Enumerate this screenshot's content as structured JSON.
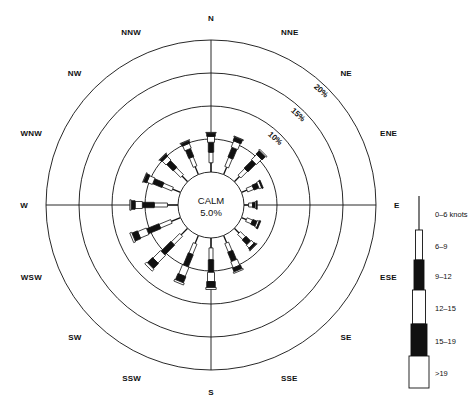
{
  "figure": {
    "title_visible": false,
    "caption": "",
    "center_label_line1": "CALM",
    "center_label_line2": "5.0%",
    "colors": {
      "stroke": "#111111",
      "fill_light": "#ffffff",
      "fill_dark": "#111111",
      "background": "#ffffff"
    }
  },
  "compass": {
    "labels": [
      "N",
      "NNE",
      "NE",
      "ENE",
      "E",
      "ESE",
      "SE",
      "SSE",
      "S",
      "SSW",
      "SW",
      "WSW",
      "W",
      "WNW",
      "NW",
      "NNW"
    ]
  },
  "rings": {
    "labels": [
      "10%",
      "15%",
      "20%"
    ],
    "values": [
      10,
      15,
      20
    ],
    "max": 20
  },
  "legend": {
    "items": [
      {
        "label": "0–6 knots",
        "fill": "line",
        "width": 1.5,
        "height": 34
      },
      {
        "label": "6–9",
        "fill": "white",
        "width": 7,
        "height": 30
      },
      {
        "label": "9–12",
        "fill": "black",
        "width": 10,
        "height": 30
      },
      {
        "label": "12–15",
        "fill": "white",
        "width": 13,
        "height": 34
      },
      {
        "label": "15–19",
        "fill": "black",
        "width": 16,
        "height": 32
      },
      {
        "label": ">19",
        "fill": "white",
        "width": 20,
        "height": 32
      }
    ]
  },
  "chart_data": {
    "type": "windrose",
    "title": "",
    "xlabel": "",
    "ylabel": "Frequency of occurrence (%)",
    "rlim": [
      0,
      20
    ],
    "grid": true,
    "calm_percent": 5.0,
    "radial_tick_labels": [
      "10%",
      "15%",
      "20%"
    ],
    "radial_ticks": [
      10,
      15,
      20
    ],
    "sectors": 16,
    "speed_bins": [
      "0–6 knots",
      "6–9",
      "9–12",
      "12–15",
      "15–19",
      ">19"
    ],
    "directions": [
      "N",
      "NNE",
      "NE",
      "ENE",
      "E",
      "ESE",
      "SE",
      "SSE",
      "S",
      "SSW",
      "SW",
      "WSW",
      "W",
      "WNW",
      "NW",
      "NNW"
    ],
    "series": [
      {
        "name": "0–6 knots",
        "values": [
          1.4,
          1.2,
          1.1,
          0.9,
          0.7,
          0.8,
          1.0,
          1.2,
          1.5,
          1.3,
          1.4,
          1.5,
          1.6,
          1.3,
          1.2,
          1.3
        ]
      },
      {
        "name": "6–9",
        "values": [
          1.6,
          1.5,
          1.4,
          1.0,
          0.6,
          0.9,
          1.1,
          1.4,
          1.8,
          1.7,
          1.8,
          1.9,
          2.0,
          1.6,
          1.5,
          1.5
        ]
      },
      {
        "name": "9–12",
        "values": [
          1.5,
          1.6,
          1.7,
          0.8,
          0.4,
          0.7,
          1.0,
          1.5,
          1.9,
          2.0,
          2.1,
          2.0,
          1.8,
          1.5,
          1.4,
          1.3
        ]
      },
      {
        "name": "12–15",
        "values": [
          0.9,
          1.0,
          1.1,
          0.4,
          0.2,
          0.3,
          0.6,
          1.0,
          1.4,
          1.5,
          1.6,
          1.4,
          1.1,
          0.9,
          0.8,
          0.8
        ]
      },
      {
        "name": "15–19",
        "values": [
          0.5,
          0.6,
          0.7,
          0.2,
          0.1,
          0.2,
          0.3,
          0.6,
          0.9,
          1.0,
          1.1,
          0.9,
          0.6,
          0.5,
          0.4,
          0.4
        ]
      },
      {
        "name": ">19",
        "values": [
          0.1,
          0.1,
          0.2,
          0.0,
          0.0,
          0.0,
          0.1,
          0.2,
          0.3,
          0.3,
          0.4,
          0.3,
          0.2,
          0.1,
          0.1,
          0.1
        ]
      }
    ],
    "totals": [
      6.0,
      6.0,
      6.2,
      3.3,
      2.0,
      2.9,
      4.1,
      5.9,
      7.8,
      7.8,
      8.4,
      8.0,
      7.3,
      5.9,
      5.4,
      5.4
    ]
  }
}
